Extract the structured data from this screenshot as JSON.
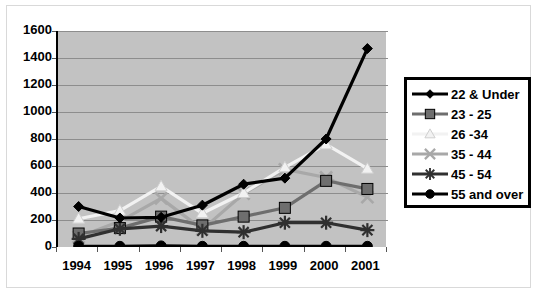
{
  "chart_data": {
    "type": "line",
    "title": "",
    "xlabel": "",
    "ylabel": "",
    "categories": [
      "1994",
      "1995",
      "1996",
      "1997",
      "1998",
      "1999",
      "2000",
      "2001"
    ],
    "ylim": [
      0,
      1600
    ],
    "ytick_step": 200,
    "yticks": [
      "1600",
      "1400",
      "1200",
      "1000",
      "800",
      "600",
      "400",
      "200",
      "0"
    ],
    "grid": true,
    "legend_position": "right",
    "series": [
      {
        "name": "22 & Under",
        "marker": "diamond",
        "color": "#000000",
        "values": [
          300,
          215,
          220,
          310,
          465,
          510,
          800,
          1470
        ]
      },
      {
        "name": "23 - 25",
        "marker": "square",
        "color": "#6e6e6e",
        "values": [
          100,
          140,
          225,
          160,
          225,
          290,
          490,
          430
        ]
      },
      {
        "name": "26 -34",
        "marker": "triangle",
        "color": "#f2f2f2",
        "values": [
          210,
          270,
          450,
          250,
          400,
          590,
          760,
          580
        ]
      },
      {
        "name": "35 - 44",
        "marker": "x",
        "color": "#a8a8a8",
        "values": [
          75,
          190,
          360,
          130,
          395,
          575,
          515,
          370
        ]
      },
      {
        "name": "45 - 54",
        "marker": "asterisk",
        "color": "#303030",
        "values": [
          60,
          135,
          155,
          120,
          110,
          180,
          180,
          125
        ]
      },
      {
        "name": "55 and over",
        "marker": "circle",
        "color": "#000000",
        "values": [
          5,
          5,
          8,
          5,
          5,
          5,
          5,
          5
        ]
      }
    ]
  },
  "legend": {
    "items": [
      {
        "label": "22 & Under"
      },
      {
        "label": "23 - 25"
      },
      {
        "label": "26 -34"
      },
      {
        "label": "35 - 44"
      },
      {
        "label": "45 - 54"
      },
      {
        "label": "55 and over"
      }
    ]
  },
  "title_fragment": ""
}
